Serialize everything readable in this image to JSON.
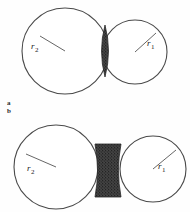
{
  "figure": {
    "background_color": "#fefefe",
    "stroke_color": "#4a4a4a",
    "fill_color": "#ffffff",
    "shade_color": "#3a3a3a",
    "width": 190,
    "height": 212
  },
  "panels": [
    {
      "id": "a",
      "caption": "a",
      "description": "two overlapping circles with shaded lens-shaped intersection",
      "circles": [
        {
          "name": "left-large-circle",
          "label": "r",
          "subscript": "2",
          "cx": 65,
          "cy": 51,
          "r": 43
        },
        {
          "name": "right-small-circle",
          "label": "r",
          "subscript": "1",
          "cx": 135,
          "cy": 52,
          "r": 32
        }
      ],
      "radius_lines": [
        {
          "name": "radius-line-r2",
          "x1": 40,
          "y1": 36,
          "x2": 65,
          "y2": 51
        },
        {
          "name": "radius-line-r1",
          "x1": 135,
          "y1": 52,
          "x2": 156,
          "y2": 33
        }
      ],
      "shaded_region": {
        "name": "lens-intersection",
        "shape": "lens",
        "cx": 105,
        "cy": 51,
        "half_width": 7,
        "half_height": 26
      },
      "labels": [
        {
          "name": "radius-label-r2-top",
          "text": "r",
          "subscript": "2"
        },
        {
          "name": "radius-label-r1-top",
          "text": "r",
          "subscript": "1"
        }
      ]
    },
    {
      "id": "b",
      "caption": "b",
      "description": "two separated circles joined by a shaded hourglass-shaped neck",
      "circles": [
        {
          "name": "left-large-circle",
          "label": "r",
          "subscript": "2",
          "cx": 56,
          "cy": 167,
          "r": 42
        },
        {
          "name": "right-small-circle",
          "label": "r",
          "subscript": "1",
          "cx": 153,
          "cy": 169,
          "r": 33
        }
      ],
      "radius_lines": [
        {
          "name": "radius-line-r2",
          "x1": 26,
          "y1": 154,
          "x2": 56,
          "y2": 167
        },
        {
          "name": "radius-line-r1",
          "x1": 153,
          "y1": 169,
          "x2": 176,
          "y2": 150
        }
      ],
      "shaded_region": {
        "name": "neck-bridge",
        "shape": "hourglass",
        "x_left": 95,
        "x_right": 121,
        "y_top": 144,
        "y_bottom": 197,
        "waist_inset": 5
      },
      "labels": [
        {
          "name": "radius-label-r2-bottom",
          "text": "r",
          "subscript": "2"
        },
        {
          "name": "radius-label-r1-bottom",
          "text": "r",
          "subscript": "1"
        }
      ]
    }
  ]
}
